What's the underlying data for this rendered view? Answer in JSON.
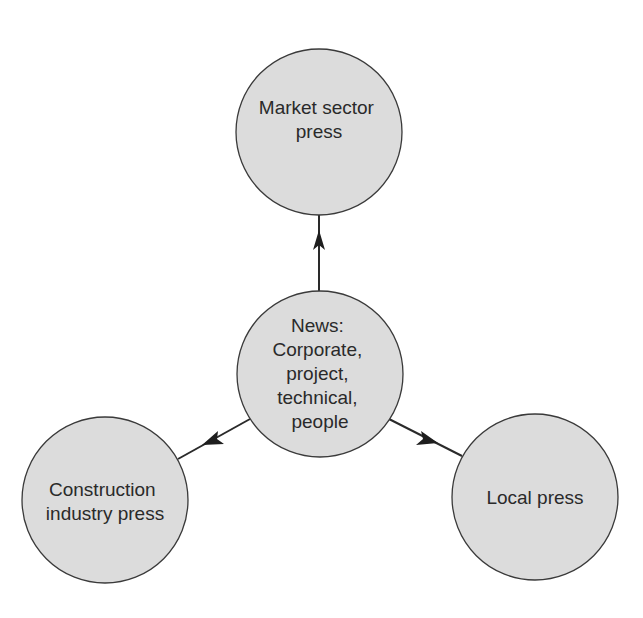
{
  "diagram": {
    "type": "hub-and-spoke",
    "center": {
      "id": "news",
      "lines": [
        "News:",
        "Corporate,",
        "project,",
        "technical,",
        "people"
      ]
    },
    "nodes": [
      {
        "id": "market",
        "lines": [
          "Market sector",
          "press"
        ]
      },
      {
        "id": "construction",
        "lines": [
          "Construction",
          "industry press"
        ]
      },
      {
        "id": "local",
        "lines": [
          "Local press"
        ]
      }
    ],
    "edges": [
      {
        "from": "news",
        "to": "market",
        "directed": true
      },
      {
        "from": "news",
        "to": "construction",
        "directed": true
      },
      {
        "from": "news",
        "to": "local",
        "directed": true
      }
    ],
    "colors": {
      "node_fill": "#dcdcdc",
      "node_stroke": "#3a3a3a",
      "edge": "#2a2a2a",
      "text": "#2a2a2a"
    }
  }
}
